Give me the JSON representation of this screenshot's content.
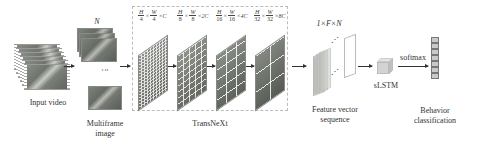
{
  "diagram": {
    "stages": [
      {
        "id": "input",
        "label": "Input video"
      },
      {
        "id": "multiframe",
        "label_line1": "Multiframe",
        "label_line2": "image",
        "count_symbol": "N"
      },
      {
        "id": "backbone",
        "label": "TransNeXt",
        "feature_maps": [
          {
            "h_num": "H",
            "h_den": "4",
            "w_num": "W",
            "w_den": "4",
            "channels": "×C"
          },
          {
            "h_num": "H",
            "h_den": "8",
            "w_num": "W",
            "w_den": "8",
            "channels": "×2C"
          },
          {
            "h_num": "H",
            "h_den": "16",
            "w_num": "W",
            "w_den": "16",
            "channels": "×4C"
          },
          {
            "h_num": "H",
            "h_den": "32",
            "w_num": "W",
            "w_den": "32",
            "channels": "×8C"
          }
        ],
        "times": "×"
      },
      {
        "id": "features",
        "label_line1": "Feature vector",
        "label_line2": "sequence",
        "dims": "1×F×N"
      },
      {
        "id": "slstm",
        "label": "sLSTM"
      },
      {
        "id": "output",
        "label_line1": "Behavior",
        "label_line2": "classification",
        "arrow_label": "softmax",
        "cells": 7
      }
    ]
  }
}
